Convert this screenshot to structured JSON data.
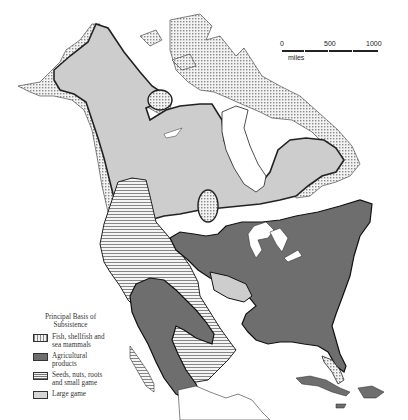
{
  "map": {
    "region": "North America",
    "colors": {
      "fish": "#d4d4d4",
      "agriculture": "#6e6e6e",
      "seeds": "#e6e6e6",
      "large_game": "#cfcfcf",
      "water": "#ffffff",
      "outline": "#222222"
    }
  },
  "scale": {
    "ticks": [
      "0",
      "500",
      "1000"
    ],
    "unit": "miles"
  },
  "legend": {
    "title": "Principal Basis of Subsistence",
    "items": [
      {
        "label": "Fish, shellfish and sea mammals",
        "pattern": "dotted"
      },
      {
        "label": "Agricultural products",
        "pattern": "dark"
      },
      {
        "label": "Seeds, nuts, roots and small game",
        "pattern": "lined"
      },
      {
        "label": "Large game",
        "pattern": "light"
      }
    ]
  }
}
